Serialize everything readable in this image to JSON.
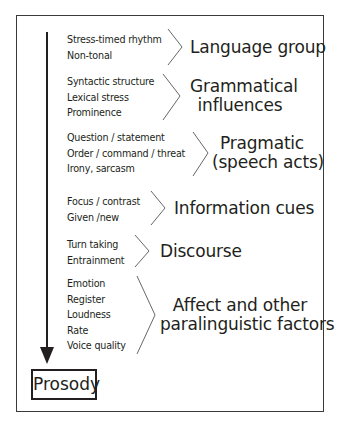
{
  "diagram": {
    "end_node": "Prosody",
    "groups": [
      {
        "items": [
          "Stress-timed rhythm",
          "Non-tonal"
        ],
        "label": [
          "Language group"
        ]
      },
      {
        "items": [
          "Syntactic structure",
          "Lexical stress",
          "Prominence"
        ],
        "label": [
          "Grammatical",
          "influences"
        ]
      },
      {
        "items": [
          "Question /  statement",
          "Order / command / threat",
          "Irony, sarcasm"
        ],
        "label": [
          "Pragmatic",
          "(speech acts)"
        ]
      },
      {
        "items": [
          "Focus / contrast",
          "Given /new"
        ],
        "label": [
          "Information cues"
        ]
      },
      {
        "items": [
          "Turn taking",
          "Entrainment"
        ],
        "label": [
          "Discourse"
        ]
      },
      {
        "items": [
          "Emotion",
          "Register",
          "Loudness",
          "Rate",
          "Voice quality"
        ],
        "label": [
          "Affect and other",
          "paralinguistic factors"
        ]
      }
    ]
  }
}
